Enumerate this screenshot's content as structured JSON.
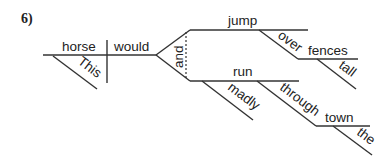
{
  "problem_number": "6)",
  "words": {
    "subject": "horse",
    "subject_modifier": "This",
    "verb_helper": "would",
    "conjunction": "and",
    "verb1": "jump",
    "prep1": "over",
    "prep1_object": "fences",
    "prep1_object_modifier": "tall",
    "verb2": "run",
    "verb2_modifier": "madly",
    "prep2": "through",
    "prep2_object": "town",
    "prep2_object_modifier": "the"
  }
}
